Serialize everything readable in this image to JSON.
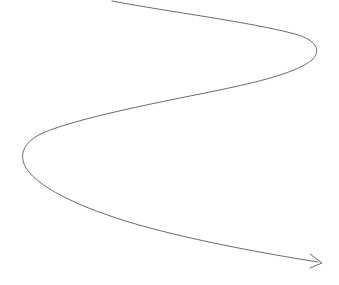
{
  "canvas": {
    "width": 339,
    "height": 285,
    "background_color": "#ffffff"
  },
  "figure": {
    "name": "spiral-arrow",
    "stroke_color": "#5a5a5a",
    "stroke_width": 0.9,
    "fill": "none",
    "has_text": false,
    "geometry": {
      "start_point": [
        112,
        1
      ],
      "end_point": [
        322,
        263
      ],
      "right_cusp": [
        318,
        42
      ],
      "left_cusp": [
        21,
        158
      ],
      "path_d": "M 112 1 C 170 12, 250 22, 295 34 C 316 40, 322 50, 312 60 C 295 74, 250 84, 200 94 C 150 104, 80 118, 45 132 C 24 141, 18 154, 26 168 C 40 190, 90 212, 150 228 C 210 244, 280 256, 318 262",
      "arrow_head_d": "M 310 254 L 322 263 L 310 268"
    }
  }
}
